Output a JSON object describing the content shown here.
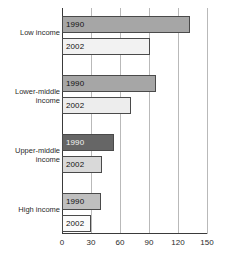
{
  "chart_data": {
    "type": "bar",
    "orientation": "horizontal",
    "title": "",
    "subtitle": "",
    "xlabel": "",
    "ylabel": "",
    "xlim": [
      0,
      150
    ],
    "xticks": [
      0,
      30,
      60,
      90,
      120,
      150
    ],
    "grid": "vertical",
    "legend": "none",
    "categories": [
      "Low income",
      "Lower-middle\nincome",
      "Upper-middle\nincome",
      "High income"
    ],
    "series": [
      {
        "name": "1990",
        "values": [
          132,
          97,
          54,
          40
        ]
      },
      {
        "name": "2002",
        "values": [
          91,
          71,
          41,
          30
        ]
      }
    ],
    "bar_colors": {
      "low_income_1990": "#a6a6a6",
      "low_income_2002": "#f2f2f2",
      "lower_middle_1990": "#a6a6a6",
      "lower_middle_2002": "#ededed",
      "upper_middle_1990": "#666666",
      "upper_middle_2002": "#d9d9d9",
      "high_income_1990": "#bfbfbf",
      "high_income_2002": "#fbfbfb"
    },
    "bars": [
      {
        "category": "Low income",
        "series": "1990",
        "value": 132,
        "label": "1990",
        "color": "#a6a6a6"
      },
      {
        "category": "Low income",
        "series": "2002",
        "value": 91,
        "label": "2002",
        "color": "#f2f2f2"
      },
      {
        "category": "Lower-middle income",
        "series": "1990",
        "value": 97,
        "label": "1990",
        "color": "#a6a6a6"
      },
      {
        "category": "Lower-middle income",
        "series": "2002",
        "value": 71,
        "label": "2002",
        "color": "#ededed"
      },
      {
        "category": "Upper-middle income",
        "series": "1990",
        "value": 54,
        "label": "1990",
        "color": "#666666"
      },
      {
        "category": "Upper-middle income",
        "series": "2002",
        "value": 41,
        "label": "2002",
        "color": "#d9d9d9"
      },
      {
        "category": "High income",
        "series": "1990",
        "value": 40,
        "label": "1990",
        "color": "#bfbfbf"
      },
      {
        "category": "High income",
        "series": "2002",
        "value": 30,
        "label": "2002",
        "color": "#fbfbfb"
      }
    ]
  },
  "axis": {
    "ticks": [
      {
        "label": "0",
        "value": 0
      },
      {
        "label": "30",
        "value": 30
      },
      {
        "label": "60",
        "value": 60
      },
      {
        "label": "90",
        "value": 90
      },
      {
        "label": "120",
        "value": 120
      },
      {
        "label": "150",
        "value": 150
      }
    ]
  },
  "categories": [
    {
      "label": "Low income"
    },
    {
      "label": "Lower-middle\nincome"
    },
    {
      "label": "Upper-middle\nincome"
    },
    {
      "label": "High income"
    }
  ],
  "caption": {
    "text": ""
  },
  "colors": {
    "axis": "#3a3a3a",
    "grid": "#b9b9b9",
    "bar_outline": "#4a4a4a",
    "text": "#2b2b2b",
    "background": "#ffffff"
  }
}
